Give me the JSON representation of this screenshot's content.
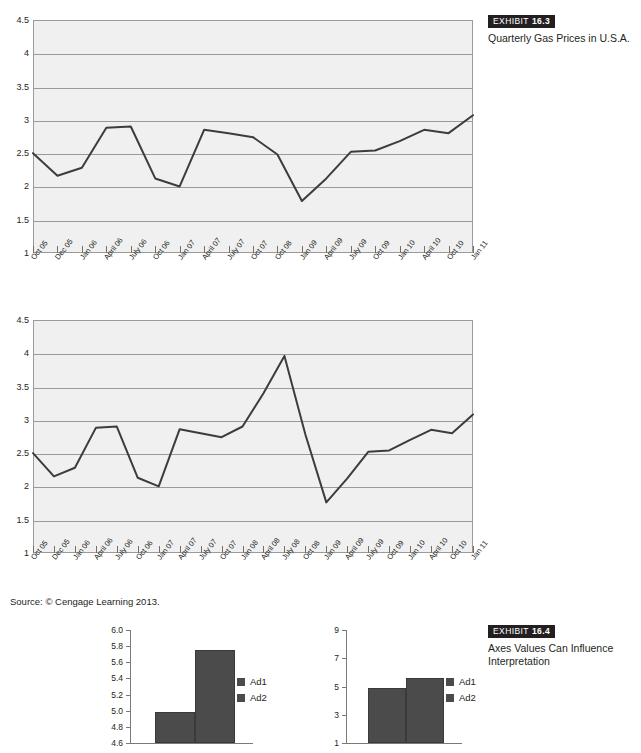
{
  "exhibit_163": {
    "tag_word": "EXHIBIT",
    "tag_num": "16.3",
    "title": "Quarterly Gas Prices in U.S.A."
  },
  "exhibit_164": {
    "tag_word": "EXHIBIT",
    "tag_num": "16.4",
    "title_line1": "Axes Values Can Influence",
    "title_line2": "Interpretation"
  },
  "source": "Source: © Cengage Learning 2013.",
  "legend": {
    "ad1": "Ad1",
    "ad2": "Ad2",
    "swatch_color": "#4b4b4b"
  },
  "chart_data": [
    {
      "id": "gas-prices-chart-1",
      "type": "line",
      "title": "Quarterly Gas Prices in U.S.A.",
      "xlabel": "",
      "ylabel": "",
      "ylim": [
        1,
        4.5
      ],
      "yticks": [
        "1",
        "1.5",
        "2",
        "2.5",
        "3",
        "3.5",
        "4",
        "4.5"
      ],
      "ytick_values": [
        1,
        1.5,
        2,
        2.5,
        3,
        3.5,
        4,
        4.5
      ],
      "grid": true,
      "legend_position": "none",
      "categories": [
        "Oct 05",
        "Dec 05",
        "Jan 06",
        "April 06",
        "July 06",
        "Oct 06",
        "Jan 07",
        "April 07",
        "July 07",
        "Oct 07",
        "Oct 08",
        "Jan 09",
        "April 09",
        "July 09",
        "Oct 09",
        "Jan 10",
        "April 10",
        "Oct 10",
        "Jan 11"
      ],
      "values": [
        2.5,
        2.16,
        2.28,
        2.88,
        2.9,
        2.12,
        2.0,
        2.85,
        2.8,
        2.74,
        2.48,
        1.78,
        2.12,
        2.52,
        2.54,
        2.68,
        2.85,
        2.8,
        3.07
      ]
    },
    {
      "id": "gas-prices-chart-2",
      "type": "line",
      "title": "Quarterly Gas Prices in U.S.A.",
      "xlabel": "",
      "ylabel": "",
      "ylim": [
        1,
        4.5
      ],
      "yticks": [
        "1",
        "1.5",
        "2",
        "2.5",
        "3",
        "3.5",
        "4",
        "4.5"
      ],
      "ytick_values": [
        1,
        1.5,
        2,
        2.5,
        3,
        3.5,
        4,
        4.5
      ],
      "grid": true,
      "legend_position": "none",
      "categories": [
        "Oct 05",
        "Dec 05",
        "Jan 06",
        "April 06",
        "July 06",
        "Oct 06",
        "Jan 07",
        "April 07",
        "July 07",
        "Oct 07",
        "Jan 08",
        "April 08",
        "July 08",
        "Oct 08",
        "Jan 09",
        "April 09",
        "July 09",
        "Oct 09",
        "Jan 10",
        "April 10",
        "Oct 10",
        "Jan 11"
      ],
      "values": [
        2.5,
        2.15,
        2.28,
        2.88,
        2.9,
        2.13,
        2.0,
        2.86,
        2.8,
        2.74,
        2.9,
        3.4,
        3.96,
        2.78,
        1.76,
        2.12,
        2.52,
        2.54,
        2.7,
        2.85,
        2.8,
        3.08
      ]
    },
    {
      "id": "ad-comparison-narrow-axis",
      "type": "bar",
      "title": "",
      "xlabel": "",
      "ylabel": "",
      "ylim": [
        4.6,
        6.0
      ],
      "yticks": [
        "4.6",
        "4.8",
        "5.0",
        "5.2",
        "5.4",
        "5.6",
        "5.8",
        "6.0"
      ],
      "ytick_values": [
        4.6,
        4.8,
        5.0,
        5.2,
        5.4,
        5.6,
        5.8,
        6.0
      ],
      "grid": false,
      "legend_position": "right",
      "categories": [
        "Ad1",
        "Ad2"
      ],
      "values": [
        4.99,
        5.75
      ]
    },
    {
      "id": "ad-comparison-wide-axis",
      "type": "bar",
      "title": "",
      "xlabel": "",
      "ylabel": "",
      "ylim": [
        1,
        9
      ],
      "yticks": [
        "1",
        "3",
        "5",
        "7",
        "9"
      ],
      "ytick_values": [
        1,
        3,
        5,
        7,
        9
      ],
      "grid": false,
      "legend_position": "right",
      "categories": [
        "Ad1",
        "Ad2"
      ],
      "values": [
        4.9,
        5.6
      ]
    }
  ]
}
